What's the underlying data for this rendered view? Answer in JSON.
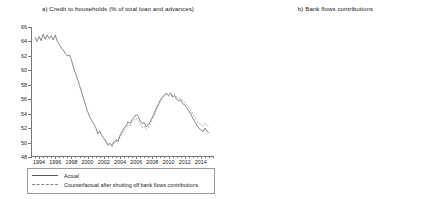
{
  "figure": {
    "background": "#ffffff",
    "width": 447,
    "height": 199
  },
  "panel_a": {
    "title": "a) Credit to households (% of total loan and advances)",
    "legend": {
      "items": [
        {
          "label": "Actual",
          "style": "solid",
          "color": "#555555"
        },
        {
          "label": "Counterfactual after shutting off bank flows contributions",
          "style": "dashed",
          "color": "#888888"
        }
      ]
    }
  },
  "panel_b": {
    "title": "b) Bank flows contributions"
  },
  "chart_data": [
    {
      "id": "panel-a",
      "type": "line",
      "title": "a) Credit to households (% of total loan and advances)",
      "xlabel": "",
      "ylabel": "",
      "xlim": [
        1993.0,
        2015.5
      ],
      "ylim": [
        48,
        66
      ],
      "yticks": [
        48,
        50,
        52,
        54,
        56,
        58,
        60,
        62,
        64,
        66
      ],
      "ytick_labels": [
        "48",
        "50",
        "52",
        "54",
        "56",
        "58",
        "60",
        "62",
        "64",
        "66"
      ],
      "xticks": [
        1994,
        1996,
        1998,
        2000,
        2002,
        2004,
        2006,
        2008,
        2010,
        2012,
        2014
      ],
      "xtick_labels": [
        "1994",
        "1996",
        "1998",
        "2000",
        "2002",
        "2004",
        "2006",
        "2008",
        "2010",
        "2012",
        "2014"
      ],
      "grid": false,
      "legend_position": "below-axes",
      "series": [
        {
          "name": "Actual",
          "style": "solid",
          "color": "#555555",
          "x": [
            1993.5,
            1993.75,
            1994.0,
            1994.25,
            1994.5,
            1994.75,
            1995.0,
            1995.25,
            1995.5,
            1995.75,
            1996.0,
            1996.25,
            1996.5,
            1996.75,
            1997.0,
            1997.25,
            1997.5,
            1997.75,
            1998.0,
            1998.25,
            1998.5,
            1998.75,
            1999.0,
            1999.25,
            1999.5,
            1999.75,
            2000.0,
            2000.25,
            2000.5,
            2000.75,
            2001.0,
            2001.25,
            2001.5,
            2001.75,
            2002.0,
            2002.25,
            2002.5,
            2002.75,
            2003.0,
            2003.25,
            2003.5,
            2003.75,
            2004.0,
            2004.25,
            2004.5,
            2004.75,
            2005.0,
            2005.25,
            2005.5,
            2005.75,
            2006.0,
            2006.25,
            2006.5,
            2006.75,
            2007.0,
            2007.25,
            2007.5,
            2007.75,
            2008.0,
            2008.25,
            2008.5,
            2008.75,
            2009.0,
            2009.25,
            2009.5,
            2009.75,
            2010.0,
            2010.25,
            2010.5,
            2010.75,
            2011.0,
            2011.25,
            2011.5,
            2011.75,
            2012.0,
            2012.25,
            2012.5,
            2012.75,
            2013.0,
            2013.25,
            2013.5,
            2013.75,
            2014.0,
            2014.25,
            2014.5,
            2014.75,
            2015.0
          ],
          "y": [
            64.6,
            64.0,
            64.7,
            64.1,
            65.0,
            64.3,
            64.9,
            64.4,
            64.8,
            64.2,
            64.9,
            64.0,
            63.6,
            63.1,
            62.8,
            62.3,
            62.0,
            62.1,
            61.4,
            60.4,
            59.6,
            58.8,
            57.9,
            57.0,
            56.1,
            55.1,
            54.3,
            53.6,
            53.0,
            52.6,
            52.1,
            51.2,
            51.6,
            51.0,
            50.6,
            50.2,
            49.7,
            49.9,
            49.6,
            50.1,
            50.4,
            50.2,
            51.0,
            51.5,
            52.0,
            52.3,
            52.9,
            52.6,
            53.2,
            53.5,
            53.9,
            53.6,
            53.0,
            52.6,
            52.8,
            52.2,
            52.5,
            52.9,
            53.5,
            54.1,
            54.8,
            55.3,
            55.9,
            56.3,
            56.6,
            56.8,
            56.5,
            56.8,
            56.3,
            56.5,
            56.0,
            55.8,
            55.9,
            55.4,
            55.2,
            54.8,
            54.4,
            53.9,
            53.4,
            52.9,
            52.4,
            52.0,
            51.8,
            51.5,
            52.0,
            51.6,
            51.3
          ]
        },
        {
          "name": "Counterfactual after shutting off bank flows contributions",
          "style": "dashed",
          "color": "#888888",
          "x": [
            2002.0,
            2002.25,
            2002.5,
            2002.75,
            2003.0,
            2003.25,
            2003.5,
            2003.75,
            2004.0,
            2004.25,
            2004.5,
            2004.75,
            2005.0,
            2005.25,
            2005.5,
            2005.75,
            2006.0,
            2006.25,
            2006.5,
            2006.75,
            2007.0,
            2007.25,
            2007.5,
            2007.75,
            2008.0,
            2008.25,
            2008.5,
            2008.75,
            2009.0,
            2009.25,
            2009.5,
            2009.75,
            2010.0,
            2010.25,
            2010.5,
            2010.75,
            2011.0,
            2011.25,
            2011.5,
            2011.75,
            2012.0,
            2012.25,
            2012.5,
            2012.75,
            2013.0,
            2013.25,
            2013.5,
            2013.75,
            2014.0,
            2014.25,
            2014.5,
            2014.75,
            2015.0
          ],
          "y": [
            50.5,
            50.1,
            49.6,
            49.8,
            49.4,
            49.9,
            50.2,
            50.0,
            50.7,
            51.2,
            51.7,
            52.0,
            52.5,
            52.2,
            52.8,
            53.1,
            53.4,
            53.1,
            52.5,
            52.1,
            52.3,
            51.8,
            52.1,
            52.6,
            53.2,
            53.8,
            54.5,
            55.1,
            55.7,
            56.1,
            56.5,
            56.7,
            56.4,
            56.9,
            56.5,
            56.7,
            56.3,
            56.1,
            56.2,
            55.8,
            55.6,
            55.2,
            54.9,
            54.4,
            53.9,
            53.5,
            53.0,
            52.7,
            52.5,
            52.3,
            52.7,
            52.4,
            52.1
          ]
        }
      ]
    },
    {
      "id": "panel-b",
      "type": "bar",
      "title": "b) Bank flows contributions",
      "xlabel": "",
      "ylabel": "",
      "xlim": [
        1999.0,
        2015.5
      ],
      "ylim": [
        -1.0,
        1.0
      ],
      "yticks": [
        -1.0,
        -0.75,
        -0.5,
        -0.25,
        0.0,
        0.25,
        0.5,
        0.75,
        1.0
      ],
      "ytick_labels": [
        "-1.00",
        "-0.75",
        "-0.50",
        "-0.25",
        "0.00",
        "0.25",
        "0.50",
        "0.75",
        "1.00"
      ],
      "xticks": [
        2000,
        2002,
        2004,
        2006,
        2008,
        2010,
        2012,
        2014
      ],
      "xtick_labels": [
        "2000",
        "2002",
        "2004",
        "2006",
        "2008",
        "2010",
        "2012",
        "2014"
      ],
      "grid": false,
      "bar_color": "#000000",
      "x": [
        1999.5,
        1999.75,
        2000.0,
        2000.25,
        2000.5,
        2000.75,
        2001.0,
        2001.25,
        2001.5,
        2001.75,
        2002.0,
        2002.25,
        2002.5,
        2002.75,
        2003.0,
        2003.25,
        2003.5,
        2003.75,
        2004.0,
        2004.25,
        2004.5,
        2004.75,
        2005.0,
        2005.25,
        2005.5,
        2005.75,
        2006.0,
        2006.25,
        2006.5,
        2006.75,
        2007.0,
        2007.25,
        2007.5,
        2007.75,
        2008.0,
        2008.25,
        2008.5,
        2008.75,
        2009.0,
        2009.25,
        2009.5,
        2009.75,
        2010.0,
        2010.25,
        2010.5,
        2010.75,
        2011.0,
        2011.25,
        2011.5,
        2011.75,
        2012.0,
        2012.25,
        2012.5,
        2012.75,
        2013.0,
        2013.25,
        2013.5,
        2013.75,
        2014.0,
        2014.25,
        2014.5,
        2014.75,
        2015.0
      ],
      "values": [
        0.01,
        0.02,
        0.03,
        0.04,
        0.05,
        0.06,
        0.07,
        0.09,
        0.1,
        0.12,
        0.13,
        0.15,
        0.17,
        0.18,
        0.2,
        0.21,
        0.23,
        0.25,
        0.26,
        0.24,
        0.22,
        0.21,
        0.2,
        0.18,
        0.16,
        0.14,
        0.12,
        0.1,
        0.08,
        0.06,
        0.04,
        0.02,
        0.01,
        -0.02,
        -0.06,
        -0.07,
        -0.09,
        -0.05,
        -0.11,
        -0.21,
        -0.5,
        -0.72,
        -0.7,
        -0.33,
        -0.31,
        -0.33,
        -0.49,
        -0.44,
        -0.28,
        -0.13,
        -0.1,
        0.05,
        0.16,
        0.24,
        0.31,
        0.39,
        0.3,
        0.18,
        0.05,
        -0.09,
        -0.12,
        -0.1,
        -0.03
      ]
    }
  ]
}
